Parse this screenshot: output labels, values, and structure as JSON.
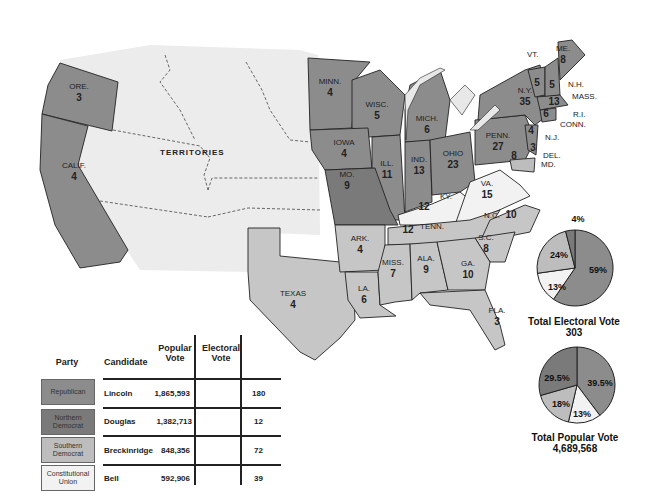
{
  "map": {
    "territories_label": "TERRITORIES",
    "states": [
      {
        "abbr": "ORE.",
        "votes": "3",
        "party": "republican"
      },
      {
        "abbr": "CALIF.",
        "votes": "4",
        "party": "republican"
      },
      {
        "abbr": "MINN.",
        "votes": "4",
        "party": "republican"
      },
      {
        "abbr": "WISC.",
        "votes": "5",
        "party": "republican"
      },
      {
        "abbr": "MICH.",
        "votes": "6",
        "party": "republican"
      },
      {
        "abbr": "IOWA",
        "votes": "4",
        "party": "republican"
      },
      {
        "abbr": "ILL.",
        "votes": "11",
        "party": "republican"
      },
      {
        "abbr": "IND.",
        "votes": "13",
        "party": "republican"
      },
      {
        "abbr": "OHIO",
        "votes": "23",
        "party": "republican"
      },
      {
        "abbr": "PENN.",
        "votes": "27",
        "party": "republican"
      },
      {
        "abbr": "N.Y.",
        "votes": "35",
        "party": "republican"
      },
      {
        "abbr": "VT.",
        "votes": "5",
        "party": "republican"
      },
      {
        "abbr": "N.H.",
        "votes": "5",
        "party": "republican"
      },
      {
        "abbr": "ME.",
        "votes": "8",
        "party": "republican"
      },
      {
        "abbr": "MASS.",
        "votes": "13",
        "party": "republican"
      },
      {
        "abbr": "R.I.",
        "votes": "4",
        "party": "republican"
      },
      {
        "abbr": "CONN.",
        "votes": "6",
        "party": "republican"
      },
      {
        "abbr": "N.J.",
        "votes": "4",
        "party": "republican_split"
      },
      {
        "abbr": "MO.",
        "votes": "9",
        "party": "northern_democrat"
      },
      {
        "abbr": "DEL.",
        "votes": "3",
        "party": "southern_democrat"
      },
      {
        "abbr": "MD.",
        "votes": "8",
        "party": "southern_democrat"
      },
      {
        "abbr": "KY.",
        "votes": "12",
        "party": "constitutional_union"
      },
      {
        "abbr": "VA.",
        "votes": "15",
        "party": "constitutional_union"
      },
      {
        "abbr": "TENN.",
        "votes": "12",
        "party": "constitutional_union"
      },
      {
        "abbr": "N.C.",
        "votes": "10",
        "party": "southern_democrat"
      },
      {
        "abbr": "S.C.",
        "votes": "8",
        "party": "southern_democrat"
      },
      {
        "abbr": "GA.",
        "votes": "10",
        "party": "southern_democrat"
      },
      {
        "abbr": "ALA.",
        "votes": "9",
        "party": "southern_democrat"
      },
      {
        "abbr": "MISS.",
        "votes": "7",
        "party": "southern_democrat"
      },
      {
        "abbr": "LA.",
        "votes": "6",
        "party": "southern_democrat"
      },
      {
        "abbr": "ARK.",
        "votes": "4",
        "party": "southern_democrat"
      },
      {
        "abbr": "TEXAS",
        "votes": "4",
        "party": "southern_democrat"
      },
      {
        "abbr": "FLA.",
        "votes": "3",
        "party": "southern_democrat"
      }
    ]
  },
  "colors": {
    "republican": "#8c8c8c",
    "northern_democrat": "#7a7a7a",
    "southern_democrat": "#bdbdbd",
    "constitutional_union": "#f2f2f2",
    "territory": "#ececec",
    "border": "#222222"
  },
  "legend": {
    "headers": {
      "party": "Party",
      "candidate": "Candidate",
      "popular": "Popular Vote",
      "electoral": "Electoral Vote"
    },
    "rows": [
      {
        "party": "Republican",
        "candidate": "Lincoln",
        "popular": "1,865,593",
        "electoral": "180"
      },
      {
        "party": "Northern Democrat",
        "candidate": "Douglas",
        "popular": "1,382,713",
        "electoral": "12"
      },
      {
        "party": "Southern Democrat",
        "candidate": "Breckinridge",
        "popular": "848,356",
        "electoral": "72"
      },
      {
        "party": "Constitutional Union",
        "candidate": "Bell",
        "popular": "592,906",
        "electoral": "39"
      }
    ]
  },
  "pies": {
    "electoral": {
      "title": "Total Electoral Vote",
      "total": "303",
      "slices": [
        {
          "party": "Republican",
          "label": "59%"
        },
        {
          "party": "Constitutional Union",
          "label": "13%"
        },
        {
          "party": "Southern Democrat",
          "label": "24%"
        },
        {
          "party": "Northern Democrat",
          "label": "4%"
        }
      ]
    },
    "popular": {
      "title": "Total Popular Vote",
      "total": "4,689,568",
      "slices": [
        {
          "party": "Republican",
          "label": "39.5%"
        },
        {
          "party": "Constitutional Union",
          "label": "13%"
        },
        {
          "party": "Southern Democrat",
          "label": "18%"
        },
        {
          "party": "Northern Democrat",
          "label": "29.5%"
        }
      ]
    }
  }
}
